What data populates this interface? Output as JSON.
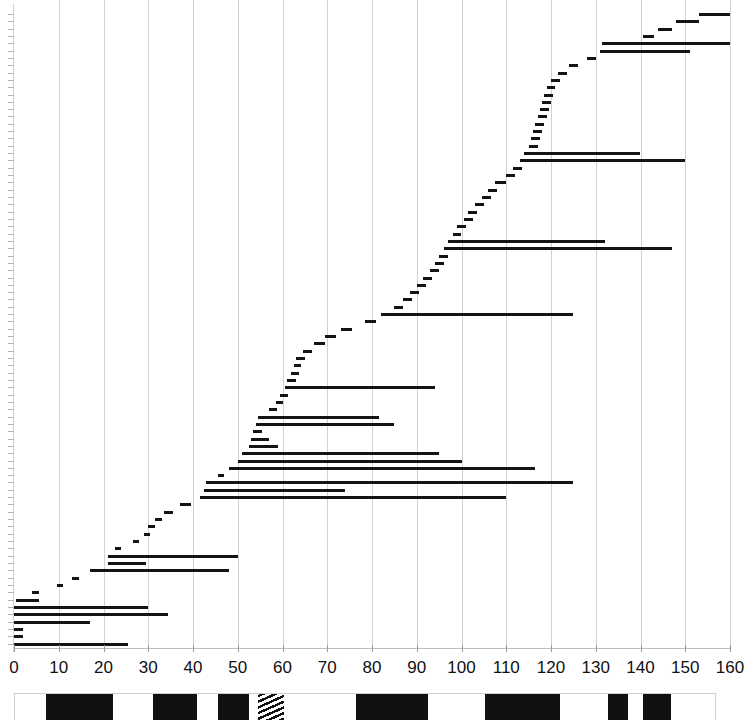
{
  "chart_data": {
    "type": "bar",
    "orientation": "horizontal",
    "title": "",
    "subtitle": "",
    "xlabel": "",
    "ylabel": "",
    "xlim": [
      0,
      160
    ],
    "ylim": [
      0,
      85
    ],
    "grid": true,
    "gridlines_every": 10,
    "legend": "none",
    "xticks": [
      0,
      10,
      20,
      30,
      40,
      50,
      60,
      70,
      80,
      90,
      100,
      110,
      120,
      130,
      140,
      150,
      160
    ],
    "xticklabels": [
      "0",
      "10",
      "20",
      "30",
      "40",
      "50",
      "60",
      "70",
      "80",
      "90",
      "100",
      "110",
      "120",
      "130",
      "140",
      "150",
      "160"
    ],
    "yticklabels": [],
    "bar_color": "#141414",
    "grid_color": "#c9c9c9",
    "intervals": [
      {
        "row": 0,
        "start": 0,
        "end": 25.5
      },
      {
        "row": 1,
        "start": 0,
        "end": 2.0
      },
      {
        "row": 2,
        "start": 0,
        "end": 2.0
      },
      {
        "row": 3,
        "start": 0,
        "end": 17.0
      },
      {
        "row": 4,
        "start": 0,
        "end": 34.5
      },
      {
        "row": 5,
        "start": 0,
        "end": 30.0
      },
      {
        "row": 6,
        "start": 0.5,
        "end": 5.5
      },
      {
        "row": 7,
        "start": 4.0,
        "end": 5.5
      },
      {
        "row": 8,
        "start": 9.5,
        "end": 11.0
      },
      {
        "row": 9,
        "start": 13.0,
        "end": 14.5
      },
      {
        "row": 10,
        "start": 17.0,
        "end": 48.0
      },
      {
        "row": 11,
        "start": 21.0,
        "end": 29.5
      },
      {
        "row": 12,
        "start": 21.0,
        "end": 50.0
      },
      {
        "row": 13,
        "start": 22.5,
        "end": 24.0
      },
      {
        "row": 14,
        "start": 26.5,
        "end": 28.0
      },
      {
        "row": 15,
        "start": 29.0,
        "end": 30.5
      },
      {
        "row": 16,
        "start": 30.0,
        "end": 31.5
      },
      {
        "row": 17,
        "start": 31.5,
        "end": 33.0
      },
      {
        "row": 18,
        "start": 33.5,
        "end": 35.5
      },
      {
        "row": 19,
        "start": 37.0,
        "end": 39.5
      },
      {
        "row": 20,
        "start": 41.5,
        "end": 110.0
      },
      {
        "row": 21,
        "start": 42.5,
        "end": 74.0
      },
      {
        "row": 22,
        "start": 43.0,
        "end": 125.0
      },
      {
        "row": 23,
        "start": 45.5,
        "end": 47.0
      },
      {
        "row": 24,
        "start": 48.0,
        "end": 116.5
      },
      {
        "row": 25,
        "start": 50.0,
        "end": 100.0
      },
      {
        "row": 26,
        "start": 51.0,
        "end": 95.0
      },
      {
        "row": 27,
        "start": 52.5,
        "end": 59.0
      },
      {
        "row": 28,
        "start": 53.0,
        "end": 57.0
      },
      {
        "row": 29,
        "start": 53.5,
        "end": 55.5
      },
      {
        "row": 30,
        "start": 54.0,
        "end": 85.0
      },
      {
        "row": 31,
        "start": 54.5,
        "end": 81.5
      },
      {
        "row": 32,
        "start": 57.0,
        "end": 58.8
      },
      {
        "row": 33,
        "start": 58.5,
        "end": 60.2
      },
      {
        "row": 34,
        "start": 59.5,
        "end": 61.2
      },
      {
        "row": 35,
        "start": 60.5,
        "end": 94.0
      },
      {
        "row": 36,
        "start": 61.0,
        "end": 63.0
      },
      {
        "row": 37,
        "start": 62.0,
        "end": 63.8
      },
      {
        "row": 38,
        "start": 62.5,
        "end": 64.2
      },
      {
        "row": 39,
        "start": 63.0,
        "end": 65.0
      },
      {
        "row": 40,
        "start": 64.5,
        "end": 66.5
      },
      {
        "row": 41,
        "start": 67.0,
        "end": 69.5
      },
      {
        "row": 42,
        "start": 69.5,
        "end": 72.0
      },
      {
        "row": 43,
        "start": 73.0,
        "end": 75.5
      },
      {
        "row": 44,
        "start": 78.5,
        "end": 81.0
      },
      {
        "row": 45,
        "start": 82.0,
        "end": 125.0
      },
      {
        "row": 46,
        "start": 85.0,
        "end": 87.0
      },
      {
        "row": 47,
        "start": 87.0,
        "end": 89.0
      },
      {
        "row": 48,
        "start": 88.5,
        "end": 90.5
      },
      {
        "row": 49,
        "start": 90.0,
        "end": 92.0
      },
      {
        "row": 50,
        "start": 91.5,
        "end": 93.5
      },
      {
        "row": 51,
        "start": 93.0,
        "end": 95.0
      },
      {
        "row": 52,
        "start": 94.0,
        "end": 96.0
      },
      {
        "row": 53,
        "start": 95.0,
        "end": 97.0
      },
      {
        "row": 54,
        "start": 96.0,
        "end": 147.0
      },
      {
        "row": 55,
        "start": 97.0,
        "end": 132.0
      },
      {
        "row": 56,
        "start": 98.0,
        "end": 100.0
      },
      {
        "row": 57,
        "start": 99.0,
        "end": 101.0
      },
      {
        "row": 58,
        "start": 100.5,
        "end": 102.5
      },
      {
        "row": 59,
        "start": 101.5,
        "end": 103.5
      },
      {
        "row": 60,
        "start": 103.0,
        "end": 105.0
      },
      {
        "row": 61,
        "start": 104.5,
        "end": 106.5
      },
      {
        "row": 62,
        "start": 106.0,
        "end": 108.0
      },
      {
        "row": 63,
        "start": 107.5,
        "end": 110.0
      },
      {
        "row": 64,
        "start": 110.0,
        "end": 112.0
      },
      {
        "row": 65,
        "start": 111.5,
        "end": 113.5
      },
      {
        "row": 66,
        "start": 113.0,
        "end": 150.0
      },
      {
        "row": 67,
        "start": 114.0,
        "end": 140.0
      },
      {
        "row": 68,
        "start": 115.0,
        "end": 117.0
      },
      {
        "row": 69,
        "start": 115.5,
        "end": 117.5
      },
      {
        "row": 70,
        "start": 116.0,
        "end": 118.0
      },
      {
        "row": 71,
        "start": 116.5,
        "end": 118.5
      },
      {
        "row": 72,
        "start": 117.0,
        "end": 119.0
      },
      {
        "row": 73,
        "start": 117.5,
        "end": 119.5
      },
      {
        "row": 74,
        "start": 118.0,
        "end": 120.0
      },
      {
        "row": 75,
        "start": 118.5,
        "end": 120.5
      },
      {
        "row": 76,
        "start": 119.0,
        "end": 121.0
      },
      {
        "row": 77,
        "start": 120.0,
        "end": 122.0
      },
      {
        "row": 78,
        "start": 121.5,
        "end": 123.5
      },
      {
        "row": 79,
        "start": 124.0,
        "end": 126.0
      },
      {
        "row": 80,
        "start": 128.0,
        "end": 130.0
      },
      {
        "row": 81,
        "start": 131.0,
        "end": 151.0
      },
      {
        "row": 82,
        "start": 131.5,
        "end": 160.0
      },
      {
        "row": 83,
        "start": 140.5,
        "end": 143.0
      },
      {
        "row": 84,
        "start": 144.0,
        "end": 147.0
      },
      {
        "row": 85,
        "start": 148.0,
        "end": 153.0
      },
      {
        "row": 86,
        "start": 153.0,
        "end": 160.0
      }
    ]
  },
  "strip": {
    "label": "sequence-track",
    "total_start": 0,
    "total_end": 160,
    "blocks": [
      {
        "start": 7.0,
        "end": 22.5,
        "pattern": "solid"
      },
      {
        "start": 31.5,
        "end": 41.5,
        "pattern": "solid"
      },
      {
        "start": 46.5,
        "end": 53.5,
        "pattern": "solid"
      },
      {
        "start": 55.5,
        "end": 61.5,
        "pattern": "hatched"
      },
      {
        "start": 78.0,
        "end": 94.5,
        "pattern": "solid"
      },
      {
        "start": 107.5,
        "end": 124.5,
        "pattern": "solid"
      },
      {
        "start": 135.5,
        "end": 140.0,
        "pattern": "solid"
      },
      {
        "start": 143.5,
        "end": 150.0,
        "pattern": "solid"
      }
    ]
  }
}
